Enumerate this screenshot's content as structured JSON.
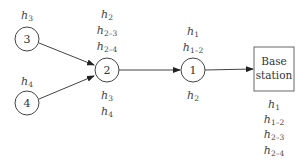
{
  "diagram": {
    "type": "data-aggregation-network",
    "nodes": [
      {
        "id": "3",
        "label": "3",
        "cx": 27,
        "cy": 39
      },
      {
        "id": "4",
        "label": "4",
        "cx": 27,
        "cy": 103
      },
      {
        "id": "2",
        "label": "2",
        "cx": 107,
        "cy": 70
      },
      {
        "id": "1",
        "label": "1",
        "cx": 193,
        "cy": 70
      }
    ],
    "base_station": {
      "label_line1": "Base",
      "label_line2": "station"
    },
    "edges": [
      {
        "from": "3",
        "to": "2"
      },
      {
        "from": "4",
        "to": "2"
      },
      {
        "from": "2",
        "to": "1"
      },
      {
        "from": "1",
        "to": "base_station"
      }
    ],
    "labels": {
      "node3": [
        {
          "base": "h",
          "sub": "3"
        }
      ],
      "node4": [
        {
          "base": "h",
          "sub": "4"
        }
      ],
      "node2_above": [
        {
          "base": "h",
          "sub": "2"
        },
        {
          "base": "h",
          "sub": "2–3"
        },
        {
          "base": "h",
          "sub": "2–4"
        }
      ],
      "node2_below": [
        {
          "base": "h",
          "sub": "3"
        },
        {
          "base": "h",
          "sub": "4"
        }
      ],
      "node1_above": [
        {
          "base": "h",
          "sub": "1"
        },
        {
          "base": "h",
          "sub": "1–2"
        }
      ],
      "node1_below": [
        {
          "base": "h",
          "sub": "2"
        }
      ],
      "station_below": [
        {
          "base": "h",
          "sub": "1"
        },
        {
          "base": "h",
          "sub": "1–2"
        },
        {
          "base": "h",
          "sub": "2–3"
        },
        {
          "base": "h",
          "sub": "2–4"
        }
      ]
    }
  }
}
